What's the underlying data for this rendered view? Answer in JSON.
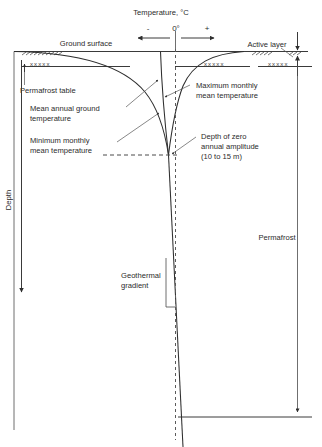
{
  "figure": {
    "type": "permafrost-ground-temperature-envelope",
    "title_axis": "Temperature, °C",
    "zero_label": "0°",
    "minus_sign": "-",
    "plus_sign": "+",
    "depth_axis_label": "Depth"
  },
  "labels": {
    "ground_surface": "Ground surface",
    "active_layer": "Active layer",
    "permafrost_table": "Permafrost table",
    "mean_annual_ground_temperature": "Mean annual ground temperature",
    "mean_annual_ground_temperature_line1": "Mean annual ground",
    "mean_annual_ground_temperature_line2": "temperature",
    "minimum_monthly_mean_temperature_line1": "Minimum monthly",
    "minimum_monthly_mean_temperature_line2": "mean temperature",
    "maximum_monthly_mean_temperature_line1": "Maximum monthly",
    "maximum_monthly_mean_temperature_line2": "mean temperature",
    "depth_zero_amplitude_line1": "Depth of zero",
    "depth_zero_amplitude_line2": "annual amplitude",
    "depth_zero_amplitude_line3": "(10 to 15 m)",
    "geothermal_gradient_line1": "Geothermal",
    "geothermal_gradient_line2": "gradient",
    "permafrost": "Permafrost",
    "ground_hatch_marks": "xxxxx"
  },
  "annotations": {
    "depth_of_zero_annual_amplitude_range": "10 to 15 m",
    "temperature_scale_negative": "-",
    "temperature_scale_positive": "+",
    "temperature_scale_zero": "0°"
  },
  "colors": {
    "line": "#3a3a3a",
    "curve": "#2e2e2e",
    "leader": "#555555",
    "text": "#2b2b2b",
    "background": "#ffffff"
  }
}
